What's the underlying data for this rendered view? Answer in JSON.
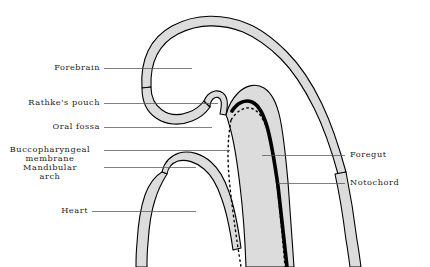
{
  "figure": {
    "colors": {
      "tissue_fill": "#dcdcdc",
      "outline": "#000000",
      "notochord": "#000000",
      "leader_line": "#555555",
      "background": "#ffffff",
      "text": "#1c1c1c"
    }
  },
  "labels": {
    "forebrain": "Forebrain",
    "rathkes_pouch": "Rathke's pouch",
    "oral_fossa": "Oral  fossa",
    "buccopharyngeal_line1": "Buccopharyngeal",
    "buccopharyngeal_line2": "membrane",
    "mandibular_line1": "Mandibular",
    "mandibular_line2": "arch",
    "heart": "Heart",
    "foregut": "Foregut",
    "notochord": "Notochord"
  }
}
